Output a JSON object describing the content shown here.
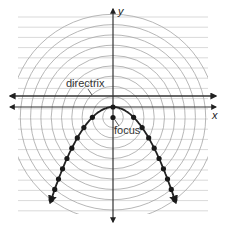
{
  "diagram": {
    "type": "parabola-focus-directrix",
    "labels": {
      "x_axis": "x",
      "y_axis": "y",
      "directrix": "directrix",
      "focus": "focus"
    },
    "colors": {
      "grid": "#c8c8c8",
      "circles": "#a8a8a8",
      "axes": "#333333",
      "curve": "#222222",
      "points": "#1a1a1a"
    },
    "geometry": {
      "origin_px": [
        113,
        107
      ],
      "unit_px": 10.3,
      "focus": [
        0,
        -1
      ],
      "vertex": [
        0,
        0
      ],
      "directrix_y": 1,
      "equation": "y = -x^2/4",
      "circle_radii_units": [
        1,
        2,
        3,
        4,
        5,
        6,
        7,
        8,
        9,
        10
      ],
      "grid_rows": 20
    }
  }
}
